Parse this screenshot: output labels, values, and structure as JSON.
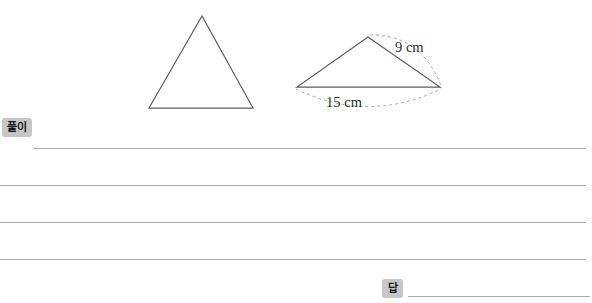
{
  "page": {
    "background_color": "#ffffff",
    "width": 592,
    "height": 303
  },
  "figures": {
    "triangle_plain": {
      "name": "plain-triangle",
      "apex": [
        202,
        16
      ],
      "bottom_left": [
        149,
        108
      ],
      "bottom_right": [
        253,
        108
      ],
      "stroke_color": "#5b5f63"
    },
    "triangle_labeled": {
      "name": "labeled-triangle",
      "apex": [
        368,
        37
      ],
      "bottom_left": [
        297,
        87
      ],
      "bottom_right": [
        440,
        87
      ],
      "stroke_color": "#5b5f63",
      "labels": [
        {
          "id": "side-label-slant",
          "text": "9 cm",
          "x": 395,
          "y": 52,
          "arc_color": "#9aa0a6"
        },
        {
          "id": "side-label-base",
          "text": "15 cm",
          "x": 344,
          "y": 107,
          "arc_color": "#9aa0a6"
        }
      ]
    }
  },
  "badges": {
    "solution": {
      "label": "풀이",
      "background_color": "#c6c6c6",
      "text_color": "#1a1a1a"
    },
    "answer": {
      "label": "답",
      "background_color": "#c6c6c6",
      "text_color": "#1a1a1a"
    }
  },
  "writing_area": {
    "rule_color": "#a9adb2",
    "rules": [
      {
        "id": "rule-1",
        "value": ""
      },
      {
        "id": "rule-2",
        "value": ""
      },
      {
        "id": "rule-3",
        "value": ""
      },
      {
        "id": "rule-4",
        "value": ""
      }
    ],
    "answer_rule": {
      "id": "rule-answer",
      "value": ""
    }
  }
}
